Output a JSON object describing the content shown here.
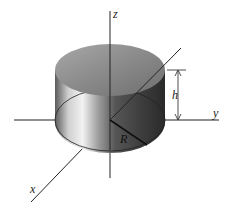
{
  "diagram": {
    "labels": {
      "z_axis": "z",
      "y_axis": "y",
      "x_axis": "x",
      "height": "h",
      "radius": "R"
    },
    "colors": {
      "background": "#ffffff",
      "axis": "#222222",
      "top_face": "#8a8a8a",
      "side_dark": "#3a3a3a",
      "side_light": "#e8e8e8"
    }
  }
}
